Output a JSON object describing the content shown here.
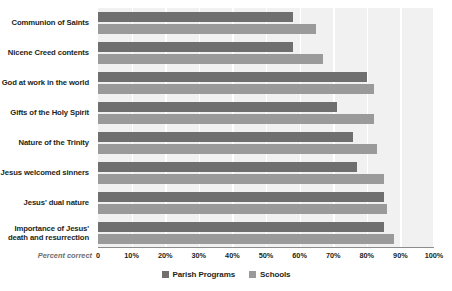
{
  "chart_data": {
    "type": "bar",
    "orientation": "horizontal",
    "title": "",
    "xlabel": "Percent correct",
    "ylabel": "",
    "xlim": [
      0,
      100
    ],
    "grid": true,
    "legend_position": "bottom-center",
    "xticks": [
      "0",
      "10%",
      "20%",
      "30%",
      "40%",
      "50%",
      "60%",
      "70%",
      "80%",
      "90%",
      "100%"
    ],
    "xtick_values": [
      0,
      10,
      20,
      30,
      40,
      50,
      60,
      70,
      80,
      90,
      100
    ],
    "categories": [
      "Communion of Saints",
      "Nicene Creed contents",
      "God at work in the world",
      "Gifts of the Holy Spirit",
      "Nature of the Trinity",
      "Jesus welcomed sinners",
      "Jesus' dual nature",
      "Importance of Jesus'\ndeath and resurrection"
    ],
    "series": [
      {
        "name": "Parish Programs",
        "color": "#6f6f6f",
        "values": [
          58,
          58,
          80,
          71,
          76,
          77,
          85,
          85
        ]
      },
      {
        "name": "Schools",
        "color": "#9a9a9a",
        "values": [
          65,
          67,
          82,
          82,
          83,
          85,
          86,
          88
        ]
      }
    ],
    "colors": {
      "plot_background": "#f1f1f1",
      "gridline": "#ffffff",
      "axis": "#8c8c8c",
      "text": "#231f20",
      "axis_title_text": "#6d6d6d"
    }
  }
}
